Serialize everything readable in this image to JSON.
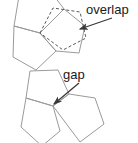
{
  "figure": {
    "background_color": "#ffffff",
    "stroke_color": "#9a9a9a",
    "dashed_stroke_color": "#5a5a5a",
    "arrow_color": "#3a3a3a",
    "text_color": "#1a1a1a",
    "stroke_width": 1
  },
  "annotations": {
    "overlap": {
      "label": "overlap",
      "text_x": 86,
      "text_y": 14,
      "arrow_from_x": 112,
      "arrow_from_y": 18,
      "arrow_to_x": 80,
      "arrow_to_y": 29
    },
    "gap": {
      "label": "gap",
      "text_x": 63,
      "text_y": 79,
      "arrow_from_x": 79,
      "arrow_from_y": 83,
      "arrow_to_x": 54,
      "arrow_to_y": 104
    }
  },
  "top_group": {
    "name": "overlap-figure",
    "shapes": [
      {
        "name": "top-left-pentagon",
        "style": "solid",
        "points": "40,33 14,26 19,-4 48,-12 64,9"
      },
      {
        "name": "bottom-pentagon",
        "style": "solid",
        "points": "40,33 14,26 13,57 36,70 56,51"
      },
      {
        "name": "right-solid-pentagon",
        "style": "solid",
        "points": "40,33 64,9 85,26 79,53 56,51"
      },
      {
        "name": "overlap-dashed-pentagon",
        "style": "dashed",
        "points": "40,33 53,8 80,12 86,38 63,50"
      }
    ]
  },
  "bottom_group": {
    "name": "gap-figure",
    "shapes": [
      {
        "name": "upper-left-pentagon",
        "style": "solid",
        "points": "53,106 26,98 30,71 58,70 69,94"
      },
      {
        "name": "lower-left-pentagon",
        "style": "solid",
        "points": "53,106 26,98 21,127 42,146 60,131"
      },
      {
        "name": "right-pentagon",
        "style": "solid",
        "points": "53,106 69,94 95,98 104,124 80,142"
      }
    ]
  }
}
